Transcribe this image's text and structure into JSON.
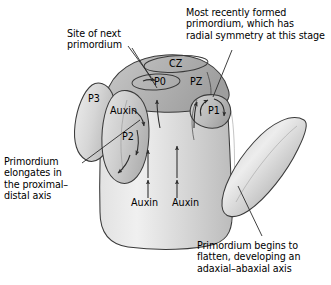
{
  "figure": {
    "background_color": "#ffffff",
    "line_color": "#2b2b2b",
    "text_color": "#000000",
    "fill_light": "#ececec",
    "fill_mid": "#c9c9c9",
    "fill_dark": "#a9a9a9"
  },
  "captions": {
    "site_of_next": "Site of next\nprimordium",
    "most_recent": "Most recently formed\nprimordium, which has\nradial symmetry at this stage",
    "elongates": "Primordium\nelongates in\nthe proximal–\ndistal axis",
    "flatten": "Primordium begins to\nflatten, developing an\nadaxial–abaxial axis"
  },
  "zones": {
    "cz": "CZ",
    "pz": "PZ",
    "p0": "P0",
    "p1": "P1",
    "p2": "P2",
    "p3": "P3"
  },
  "auxin_labels": {
    "primordium": "Auxin",
    "stem_left": "Auxin",
    "stem_right": "Auxin"
  }
}
